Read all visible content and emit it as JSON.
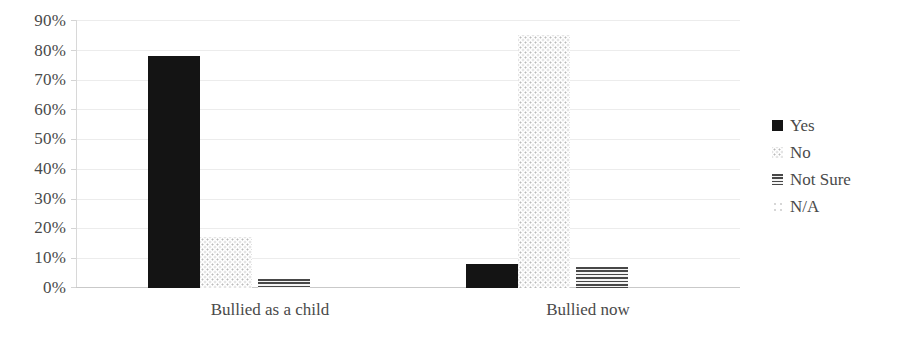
{
  "chart_data": {
    "type": "bar",
    "title": "",
    "subtitle": "",
    "xlabel": "",
    "ylabel": "",
    "categories": [
      "Bullied as a child",
      "Bullied now"
    ],
    "series": [
      {
        "name": "Yes",
        "values": [
          78,
          8
        ],
        "pattern": "solid-black"
      },
      {
        "name": "No",
        "values": [
          17,
          85
        ],
        "pattern": "light-dotted"
      },
      {
        "name": "Not Sure",
        "values": [
          3,
          7
        ],
        "pattern": "horizontal-lines"
      },
      {
        "name": "N/A",
        "values": [
          0,
          0
        ],
        "pattern": "faint-speckle"
      }
    ],
    "ylim": [
      0,
      90
    ],
    "ytick_step": 10,
    "ytick_labels": [
      "0%",
      "10%",
      "20%",
      "30%",
      "40%",
      "50%",
      "60%",
      "70%",
      "80%",
      "90%"
    ],
    "ytick_values": [
      0,
      10,
      20,
      30,
      40,
      50,
      60,
      70,
      80,
      90
    ],
    "value_format": "percent",
    "grid": true,
    "grid_axis": "y",
    "legend_position": "right",
    "colors": {
      "yes": "#141414",
      "no": "#c9c9c9",
      "not_sure": "#474747",
      "na": "#d5d5d5",
      "gridline": "#ececec",
      "axis": "#d4d4d4",
      "text": "#4a4a4a",
      "background": "#ffffff"
    }
  },
  "legend": {
    "items": [
      {
        "label": "Yes"
      },
      {
        "label": "No"
      },
      {
        "label": "Not Sure"
      },
      {
        "label": "N/A"
      }
    ]
  }
}
